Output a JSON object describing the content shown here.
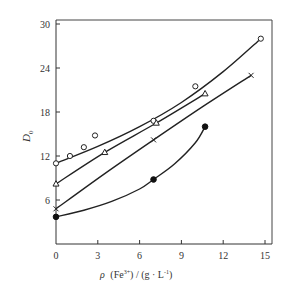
{
  "chart_data": {
    "type": "line",
    "title": "",
    "xlabel": "ρ (Fe3+) / (g · L-1)",
    "ylabel": "D0",
    "xlim": [
      0,
      15
    ],
    "ylim": [
      0,
      30
    ],
    "xticks": [
      0,
      3,
      6,
      9,
      12,
      15
    ],
    "yticks": [
      6,
      12,
      18,
      24,
      30
    ],
    "grid": false,
    "legend": null,
    "series": [
      {
        "name": "open-circle",
        "marker": "open-circle",
        "x": [
          0,
          1,
          2,
          2.8,
          7,
          10,
          14.7
        ],
        "y": [
          11,
          12,
          13.2,
          14.8,
          16.8,
          21.5,
          28
        ],
        "curve": [
          [
            0,
            11
          ],
          [
            3,
            13.3
          ],
          [
            6,
            16
          ],
          [
            9,
            19.3
          ],
          [
            12,
            23.5
          ],
          [
            14.7,
            28
          ]
        ]
      },
      {
        "name": "open-triangle",
        "marker": "open-triangle",
        "x": [
          0,
          3.5,
          7.2,
          10.7
        ],
        "y": [
          8.2,
          12.5,
          16.5,
          20.5
        ],
        "curve": [
          [
            0,
            8.2
          ],
          [
            3.5,
            12.5
          ],
          [
            7.2,
            16.5
          ],
          [
            10.7,
            20.5
          ]
        ]
      },
      {
        "name": "cross",
        "marker": "cross",
        "x": [
          0,
          7,
          14
        ],
        "y": [
          4.8,
          14.2,
          23
        ],
        "curve": [
          [
            0,
            4.8
          ],
          [
            3.5,
            9.6
          ],
          [
            7,
            14.2
          ],
          [
            10.5,
            18.7
          ],
          [
            14,
            23
          ]
        ]
      },
      {
        "name": "filled-circle",
        "marker": "filled-circle",
        "x": [
          0,
          7,
          10.7
        ],
        "y": [
          3.7,
          8.8,
          16
        ],
        "curve": [
          [
            0,
            3.7
          ],
          [
            2,
            4.6
          ],
          [
            4,
            5.8
          ],
          [
            6,
            7.5
          ],
          [
            7,
            8.8
          ],
          [
            8.5,
            10.9
          ],
          [
            10,
            13.8
          ],
          [
            10.7,
            16
          ]
        ]
      }
    ]
  },
  "axes": {
    "x_tick_labels": [
      "0",
      "3",
      "6",
      "9",
      "12",
      "15"
    ],
    "y_tick_labels": [
      "6",
      "12",
      "18",
      "24",
      "30"
    ],
    "x_label_rho": "ρ",
    "x_label_fe": "(Fe",
    "x_label_fe_sup": "3+",
    "x_label_units": ") / (g · L",
    "x_label_units_sup": "-1",
    "x_label_close": ")",
    "y_label_main": "D",
    "y_label_sub": "0"
  }
}
